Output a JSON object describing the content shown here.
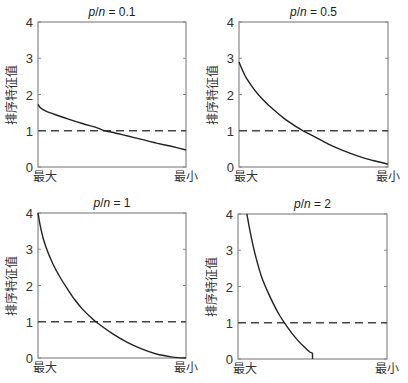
{
  "chart_data": [
    {
      "type": "line",
      "title": "p/n = 0.1",
      "title_parts": {
        "p": "p",
        "slash": "/",
        "n": "n",
        "eq": " = ",
        "value": "0.1"
      },
      "xlabel_left": "最大",
      "xlabel_right": "最小",
      "ylabel": "排序特征值",
      "ylim": [
        0,
        4
      ],
      "yticks": [
        "0",
        "1",
        "2",
        "3",
        "4"
      ],
      "reference_line": {
        "y": 1,
        "style": "dashed"
      },
      "x": [
        0,
        0.02,
        0.05,
        0.1,
        0.2,
        0.3,
        0.4,
        0.45,
        0.5,
        0.6,
        0.7,
        0.8,
        0.9,
        1.0
      ],
      "values": [
        1.73,
        1.62,
        1.55,
        1.47,
        1.33,
        1.2,
        1.08,
        1.0,
        0.96,
        0.86,
        0.76,
        0.66,
        0.57,
        0.47
      ]
    },
    {
      "type": "line",
      "title": "p/n = 0.5",
      "title_parts": {
        "p": "p",
        "slash": "/",
        "n": "n",
        "eq": " = ",
        "value": "0.5"
      },
      "xlabel_left": "最大",
      "xlabel_right": "最小",
      "ylabel": "排序特征值",
      "ylim": [
        0,
        4
      ],
      "yticks": [
        "0",
        "1",
        "2",
        "3",
        "4"
      ],
      "reference_line": {
        "y": 1,
        "style": "dashed"
      },
      "x": [
        0,
        0.02,
        0.05,
        0.1,
        0.15,
        0.2,
        0.3,
        0.4,
        0.43,
        0.5,
        0.6,
        0.7,
        0.8,
        0.9,
        1.0
      ],
      "values": [
        2.9,
        2.7,
        2.45,
        2.15,
        1.9,
        1.7,
        1.35,
        1.07,
        1.0,
        0.85,
        0.63,
        0.45,
        0.3,
        0.18,
        0.08
      ]
    },
    {
      "type": "line",
      "title": "p/n = 1",
      "title_parts": {
        "p": "p",
        "slash": "/",
        "n": "n",
        "eq": " = ",
        "value": "1"
      },
      "xlabel_left": "最大",
      "xlabel_right": "最小",
      "ylabel": "排序特征值",
      "ylim": [
        0,
        4
      ],
      "yticks": [
        "0",
        "1",
        "2",
        "3",
        "4"
      ],
      "reference_line": {
        "y": 1,
        "style": "dashed"
      },
      "x": [
        0,
        0.02,
        0.05,
        0.1,
        0.15,
        0.2,
        0.25,
        0.3,
        0.35,
        0.4,
        0.5,
        0.6,
        0.7,
        0.8,
        0.9,
        0.95,
        1.0
      ],
      "values": [
        4.0,
        3.55,
        3.1,
        2.6,
        2.22,
        1.9,
        1.6,
        1.35,
        1.15,
        0.97,
        0.68,
        0.44,
        0.25,
        0.11,
        0.03,
        0.01,
        0.0
      ]
    },
    {
      "type": "line",
      "title": "p/n = 2",
      "title_parts": {
        "p": "p",
        "slash": "/",
        "n": "n",
        "eq": " = ",
        "value": "2"
      },
      "xlabel_left": "最大",
      "xlabel_right": "最小",
      "ylabel": "排序特征值",
      "ylim": [
        0,
        4
      ],
      "yticks": [
        "0",
        "1",
        "2",
        "3",
        "4"
      ],
      "reference_line": {
        "y": 1,
        "style": "dashed"
      },
      "x": [
        0.06,
        0.08,
        0.1,
        0.13,
        0.16,
        0.2,
        0.24,
        0.28,
        0.32,
        0.36,
        0.4,
        0.44,
        0.48,
        0.5,
        0.5
      ],
      "values": [
        4.0,
        3.55,
        3.15,
        2.65,
        2.25,
        1.85,
        1.5,
        1.2,
        0.95,
        0.72,
        0.52,
        0.35,
        0.2,
        0.15,
        0.0
      ]
    }
  ]
}
